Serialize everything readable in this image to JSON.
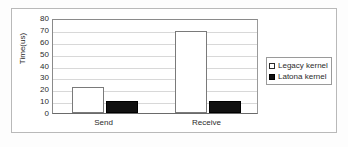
{
  "chart_data": {
    "type": "bar",
    "title": "",
    "xlabel": "",
    "ylabel": "Time(us)",
    "categories": [
      "Send",
      "Receive"
    ],
    "series": [
      {
        "name": "Legacy kernel",
        "values": [
          22,
          69
        ],
        "color": "#ffffff",
        "swatch": "hollow"
      },
      {
        "name": "Latona kernel",
        "values": [
          10.5,
          10.5
        ],
        "color": "#111111",
        "swatch": "filled"
      }
    ],
    "ylim": [
      0,
      80
    ],
    "yticks": [
      0,
      10,
      20,
      30,
      40,
      50,
      60,
      70,
      80
    ],
    "ytick_labels": [
      "0",
      "10",
      "20",
      "30",
      "40",
      "50",
      "60",
      "70",
      "80"
    ],
    "grid": true,
    "legend_position": "right-outside"
  },
  "legend": {
    "entries": [
      {
        "label": "Legacy kernel"
      },
      {
        "label": "Latona kernel"
      }
    ]
  }
}
